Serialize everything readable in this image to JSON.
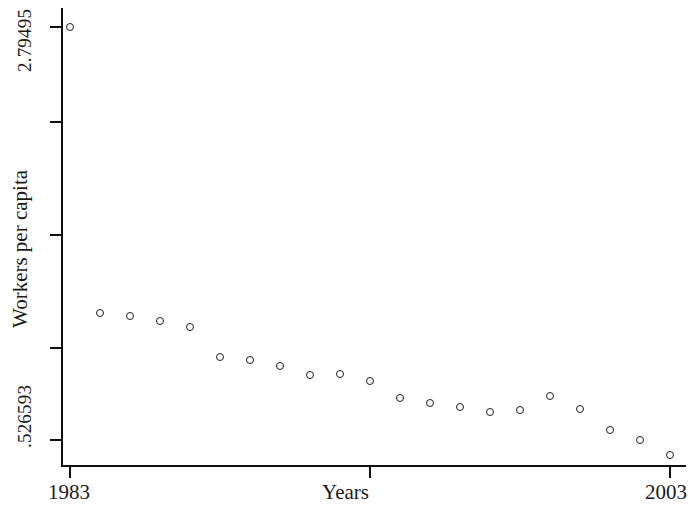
{
  "figure": {
    "background_color": "#ffffff",
    "marker_color": "#1c1c22",
    "axis_color": "#111111"
  },
  "axes": {
    "y_title": "Workers per capita",
    "x_title": "Years",
    "y_tick_labels": [
      "2.79495",
      ".526593"
    ],
    "x_tick_labels": [
      "1983",
      "2003"
    ]
  },
  "chart_data": {
    "type": "scatter",
    "title": "",
    "xlabel": "Years",
    "ylabel": "Workers per capita",
    "xlim": [
      1983,
      2003
    ],
    "ylim": [
      0.526593,
      2.79495
    ],
    "grid": false,
    "legend": null,
    "y_axis_tick_values": [
      2.79495,
      0.526593
    ],
    "x_axis_tick_values": [
      1983,
      1993,
      2003
    ],
    "marker": "open-circle",
    "x": [
      1983,
      1984,
      1985,
      1986,
      1987,
      1988,
      1989,
      1990,
      1991,
      1992,
      1993,
      1994,
      1995,
      1996,
      1997,
      1998,
      1999,
      2000,
      2001,
      2002,
      2003
    ],
    "values": [
      2.795,
      1.222,
      1.206,
      1.179,
      1.146,
      0.981,
      0.965,
      0.932,
      0.882,
      0.888,
      0.849,
      0.756,
      0.728,
      0.706,
      0.679,
      0.69,
      0.767,
      0.695,
      0.58,
      0.526,
      0.444
    ],
    "points": [
      {
        "x": 1983,
        "y": 2.795
      },
      {
        "x": 1984,
        "y": 1.222
      },
      {
        "x": 1985,
        "y": 1.206
      },
      {
        "x": 1986,
        "y": 1.179
      },
      {
        "x": 1987,
        "y": 1.146
      },
      {
        "x": 1988,
        "y": 0.981
      },
      {
        "x": 1989,
        "y": 0.965
      },
      {
        "x": 1990,
        "y": 0.932
      },
      {
        "x": 1991,
        "y": 0.882
      },
      {
        "x": 1992,
        "y": 0.888
      },
      {
        "x": 1993,
        "y": 0.849
      },
      {
        "x": 1994,
        "y": 0.756
      },
      {
        "x": 1995,
        "y": 0.728
      },
      {
        "x": 1996,
        "y": 0.706
      },
      {
        "x": 1997,
        "y": 0.679
      },
      {
        "x": 1998,
        "y": 0.69
      },
      {
        "x": 1999,
        "y": 0.767
      },
      {
        "x": 2000,
        "y": 0.695
      },
      {
        "x": 2001,
        "y": 0.58
      },
      {
        "x": 2002,
        "y": 0.526
      },
      {
        "x": 2003,
        "y": 0.444
      }
    ]
  },
  "layout": {
    "plot_left_px": 61,
    "plot_right_px": 686,
    "plot_top_px": 8,
    "plot_bottom_px": 466,
    "x_pixel_1983": 70,
    "x_pixel_2003": 670,
    "y_pixel_top_value": 27,
    "y_pixel_bottom_value": 440,
    "y_tick_pixels": [
      27,
      122,
      235,
      348,
      440
    ],
    "x_tick_pixels": [
      70,
      370,
      670
    ]
  }
}
